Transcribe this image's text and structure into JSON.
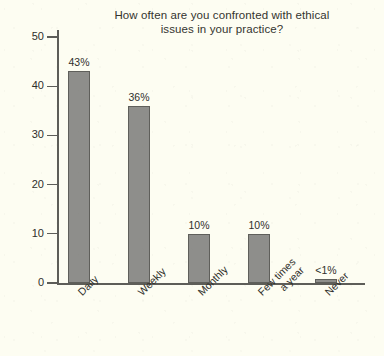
{
  "chart_data": {
    "type": "bar",
    "title": "How often are you confronted with ethical issues in your practice?",
    "title_lines": [
      "How often are you confronted with ethical",
      "issues in your practice?"
    ],
    "xlabel": "",
    "ylabel": "",
    "ylim": [
      0,
      52
    ],
    "yticks": [
      0,
      10,
      20,
      30,
      40,
      50
    ],
    "ytick_labels": [
      "0",
      "10",
      "20",
      "30",
      "40",
      "50"
    ],
    "grid": false,
    "legend": false,
    "categories": [
      "Daily",
      "Weekly",
      "Monthly",
      "Few times a year",
      "Never"
    ],
    "category_label_lines": [
      [
        "Daily"
      ],
      [
        "Weekly"
      ],
      [
        "Monthly"
      ],
      [
        "Few times",
        "a year"
      ],
      [
        "Never"
      ]
    ],
    "values": [
      43,
      36,
      10,
      10,
      0.5
    ],
    "data_labels": [
      "43%",
      "36%",
      "10%",
      "10%",
      "<1%"
    ],
    "bar_color": "#8e8e8b",
    "bar_edge_color": "#5f5f5b",
    "axis_color": "#5d5d58",
    "background_color": "#fdfdf2",
    "text_color": "#2f2f2b"
  }
}
